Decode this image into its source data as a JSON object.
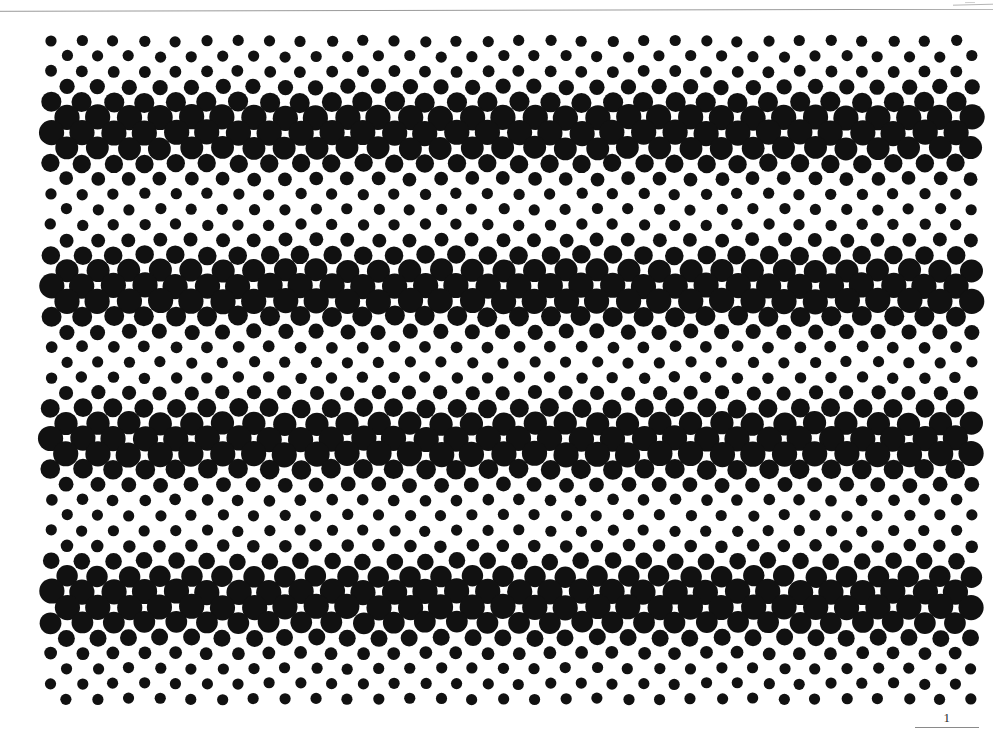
{
  "document": {
    "type": "scanned-page",
    "title": "Halftone Dot Lattice Plate",
    "background_color": "#ffffff",
    "ink_color": "#111111",
    "page_number": "1",
    "scan_edge_color": "#9a9a9a",
    "corner_mark_color": "#b5b5b5"
  },
  "chart_data": {
    "type": "scatter",
    "title": "",
    "xlabel": "",
    "ylabel": "",
    "grid": false,
    "legend": null,
    "lattice": {
      "columns": 30,
      "rows": 44,
      "x_start": 51,
      "x_spacing": 31.2,
      "y_start": 41,
      "y_spacing": 15.3,
      "row_offset_odd": 15.6,
      "radius_min": 5.6,
      "radius_max": 12.6
    },
    "band_centers_y": [
      130,
      288,
      440,
      600
    ],
    "band_half_width_y": 26,
    "xlim": [
      0,
      993
    ],
    "ylim": [
      736,
      0
    ]
  },
  "annotations": {
    "page_number_text": "1"
  }
}
